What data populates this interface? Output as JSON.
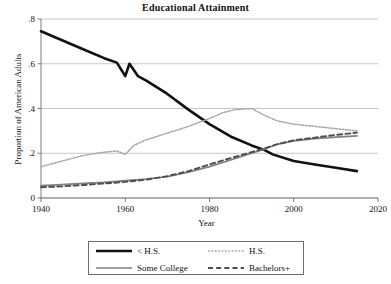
{
  "chart_data": {
    "type": "line",
    "title": "Educational Attainment",
    "xlabel": "Year",
    "ylabel": "Proportion of American Adults",
    "xlim": [
      1940,
      2020
    ],
    "ylim": [
      0,
      0.8
    ],
    "xticks": [
      1940,
      1960,
      1980,
      2000,
      2020
    ],
    "xtick_labels": [
      "1940",
      "1960",
      "1980",
      "2000",
      "2020"
    ],
    "yticks": [
      0,
      0.2,
      0.4,
      0.6,
      0.8
    ],
    "ytick_labels": [
      "0",
      ".2",
      ".4",
      ".6",
      ".8"
    ],
    "grid": "horizontal",
    "legend_position": "below-plot",
    "series": [
      {
        "name": "< H.S.",
        "color": "#111111",
        "style": "solid",
        "width": 2.6,
        "x": [
          1940,
          1945,
          1950,
          1955,
          1958,
          1960,
          1961,
          1963,
          1965,
          1970,
          1975,
          1980,
          1985,
          1990,
          1993,
          1995,
          2000,
          2005,
          2010,
          2015
        ],
        "y": [
          0.745,
          0.705,
          0.665,
          0.625,
          0.605,
          0.545,
          0.6,
          0.545,
          0.525,
          0.465,
          0.395,
          0.33,
          0.275,
          0.235,
          0.215,
          0.195,
          0.165,
          0.15,
          0.135,
          0.12
        ]
      },
      {
        "name": "H.S.",
        "color": "#a8a8a8",
        "style": "dotted",
        "width": 1.5,
        "x": [
          1940,
          1945,
          1950,
          1955,
          1958,
          1960,
          1962,
          1965,
          1970,
          1975,
          1980,
          1983,
          1986,
          1990,
          1993,
          1996,
          2000,
          2005,
          2010,
          2015
        ],
        "y": [
          0.14,
          0.165,
          0.19,
          0.205,
          0.21,
          0.195,
          0.235,
          0.26,
          0.29,
          0.32,
          0.355,
          0.38,
          0.395,
          0.4,
          0.37,
          0.345,
          0.33,
          0.32,
          0.31,
          0.3
        ]
      },
      {
        "name": "Some College",
        "color": "#808080",
        "style": "solid",
        "width": 1.7,
        "x": [
          1940,
          1945,
          1950,
          1955,
          1960,
          1965,
          1970,
          1975,
          1980,
          1985,
          1990,
          1993,
          1996,
          2000,
          2005,
          2010,
          2015
        ],
        "y": [
          0.055,
          0.06,
          0.065,
          0.07,
          0.078,
          0.085,
          0.095,
          0.115,
          0.14,
          0.17,
          0.2,
          0.218,
          0.24,
          0.255,
          0.265,
          0.272,
          0.278
        ]
      },
      {
        "name": "Bachelors+",
        "color": "#4d4d4d",
        "style": "dashed",
        "width": 1.9,
        "x": [
          1940,
          1945,
          1950,
          1955,
          1960,
          1965,
          1970,
          1975,
          1980,
          1985,
          1990,
          1993,
          1996,
          2000,
          2005,
          2010,
          2015
        ],
        "y": [
          0.048,
          0.052,
          0.058,
          0.065,
          0.072,
          0.082,
          0.098,
          0.12,
          0.15,
          0.178,
          0.205,
          0.222,
          0.24,
          0.258,
          0.27,
          0.282,
          0.292
        ]
      }
    ]
  },
  "legend": {
    "entries": [
      {
        "label": "< H.S."
      },
      {
        "label": "H.S."
      },
      {
        "label": "Some College"
      },
      {
        "label": "Bachelors+"
      }
    ]
  }
}
